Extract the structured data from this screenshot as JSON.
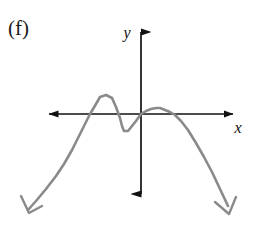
{
  "figure": {
    "part_label": "(f)",
    "caption": "",
    "background_color": "#ffffff"
  },
  "axes": {
    "x_label": "x",
    "y_label": "y",
    "axis_color": "#111111",
    "origin_px": [
      141,
      114
    ],
    "x_axis_px": {
      "start": [
        42,
        114
      ],
      "end": [
        240,
        114
      ]
    },
    "y_axis_px": {
      "start": [
        141,
        24
      ],
      "end": [
        141,
        202
      ]
    },
    "arrowheads": {
      "style": "solid-filled-triangle",
      "x_left": true,
      "x_right": true,
      "y_top": true,
      "y_bottom": true
    },
    "ticks": [],
    "tick_labels": [],
    "grid": false
  },
  "chart_data": {
    "type": "line",
    "title": "",
    "xlabel": "x",
    "ylabel": "y",
    "grid": false,
    "legend": null,
    "axis_arrows_both_directions": true,
    "curve_color": "#8a8a8a",
    "curve_end_arrow_style": "open-v",
    "end_behavior": {
      "left": "down",
      "right": "down"
    },
    "leading_coefficient_sign": "negative",
    "degree_parity": "even",
    "x_intercepts_px": [
      75,
      112,
      141,
      175
    ],
    "x_intercepts": [
      -2.2,
      -1.0,
      0.0,
      1.2
    ],
    "local_extrema": [
      {
        "type": "local-maximum",
        "px": [
          100,
          97
        ],
        "xy": [
          -1.6,
          0.6
        ]
      },
      {
        "type": "local-minimum",
        "px": [
          122,
          130
        ],
        "xy": [
          -0.55,
          -0.45
        ]
      },
      {
        "type": "local-maximum",
        "px": [
          158,
          108
        ],
        "xy": [
          0.6,
          0.18
        ]
      }
    ],
    "x": [
      -3.4,
      -3.2,
      -3.0,
      -2.8,
      -2.6,
      -2.4,
      -2.2,
      -2.0,
      -1.8,
      -1.6,
      -1.4,
      -1.2,
      -1.0,
      -0.8,
      -0.55,
      -0.3,
      0.0,
      0.3,
      0.6,
      0.9,
      1.2,
      1.5,
      1.8,
      2.1,
      2.4,
      2.7,
      3.0
    ],
    "y": [
      -3.0,
      -2.2,
      -1.55,
      -1.0,
      -0.55,
      -0.2,
      0.0,
      0.32,
      0.54,
      0.6,
      0.5,
      0.25,
      0.0,
      -0.3,
      -0.45,
      -0.28,
      0.0,
      0.14,
      0.18,
      0.1,
      0.0,
      -0.35,
      -0.85,
      -1.45,
      -2.15,
      -2.9,
      -3.6
    ],
    "polyline_px": "28,210 36,201 46,189 56,176 64,164 72,150 78,138 84,126 90,114 96,104 100,97 106,95 112,98 116,107 120,118 122,126 124,131 128,131 132,126 136,121 141,114 146,111 151,109 156,108 160,108 165,110 170,112 175,115 181,121 188,130 196,143 204,157 212,172 220,189 228,206",
    "xlim_px": [
      28,
      232
    ],
    "ylim_px": [
      92,
      214
    ]
  }
}
